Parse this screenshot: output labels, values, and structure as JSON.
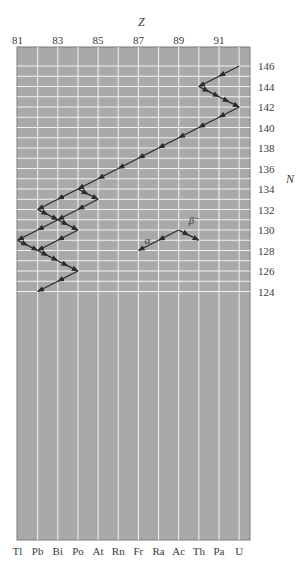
{
  "chart_data": {
    "type": "diagram",
    "top_axis": {
      "label": "Z",
      "ticks": [
        81,
        83,
        85,
        87,
        89,
        91
      ]
    },
    "right_axis": {
      "label": "N",
      "ticks": [
        146,
        144,
        142,
        140,
        138,
        136,
        134,
        132,
        130,
        128,
        126,
        124
      ]
    },
    "bottom_axis": {
      "elements": [
        "Tl",
        "Pb",
        "Bi",
        "Po",
        "At",
        "Rn",
        "Fr",
        "Ra",
        "Ac",
        "Th",
        "Pa",
        "U"
      ],
      "z_start": 81
    },
    "grid": {
      "z_min": 81,
      "z_max": 92,
      "n_min": 123,
      "n_max": 147,
      "on": true
    },
    "colors": {
      "background": "#a9a9a9",
      "grid_line": "#f2f2f2",
      "arrow": "#2b2b2b"
    },
    "decays": [
      {
        "type": "alpha",
        "from": [
          92,
          146
        ],
        "to": [
          90,
          144
        ]
      },
      {
        "type": "beta",
        "from": [
          90,
          144
        ],
        "to": [
          91,
          143
        ]
      },
      {
        "type": "beta",
        "from": [
          91,
          143
        ],
        "to": [
          92,
          142
        ]
      },
      {
        "type": "alpha",
        "from": [
          92,
          142
        ],
        "to": [
          90,
          140
        ]
      },
      {
        "type": "alpha",
        "from": [
          90,
          140
        ],
        "to": [
          88,
          138
        ]
      },
      {
        "type": "alpha",
        "from": [
          88,
          138
        ],
        "to": [
          86,
          136
        ]
      },
      {
        "type": "alpha",
        "from": [
          86,
          136
        ],
        "to": [
          84,
          134
        ]
      },
      {
        "type": "alpha",
        "from": [
          84,
          134
        ],
        "to": [
          82,
          132
        ]
      },
      {
        "type": "beta",
        "from": [
          84,
          134
        ],
        "to": [
          85,
          133
        ]
      },
      {
        "type": "alpha",
        "from": [
          85,
          133
        ],
        "to": [
          83,
          131
        ]
      },
      {
        "type": "beta",
        "from": [
          82,
          132
        ],
        "to": [
          83,
          131
        ]
      },
      {
        "type": "alpha",
        "from": [
          83,
          131
        ],
        "to": [
          81,
          129
        ]
      },
      {
        "type": "beta",
        "from": [
          83,
          131
        ],
        "to": [
          84,
          130
        ]
      },
      {
        "type": "alpha",
        "from": [
          84,
          130
        ],
        "to": [
          82,
          128
        ]
      },
      {
        "type": "beta",
        "from": [
          81,
          129
        ],
        "to": [
          82,
          128
        ]
      },
      {
        "type": "beta",
        "from": [
          82,
          128
        ],
        "to": [
          83,
          127
        ]
      },
      {
        "type": "beta",
        "from": [
          83,
          127
        ],
        "to": [
          84,
          126
        ]
      },
      {
        "type": "alpha",
        "from": [
          84,
          126
        ],
        "to": [
          82,
          124
        ]
      }
    ],
    "legend": {
      "alpha_label": "α",
      "beta_label": "β⁻",
      "origin": [
        89,
        130
      ],
      "alpha_to": [
        87,
        128
      ],
      "beta_to": [
        90,
        129
      ]
    }
  }
}
